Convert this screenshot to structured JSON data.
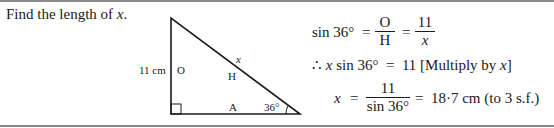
{
  "question": {
    "text": "Find the length of ",
    "variable": "x",
    "end": "."
  },
  "diagram": {
    "side_label": "11 cm",
    "opposite": "O",
    "hypotenuse": "H",
    "hyp_var": "x",
    "adjacent": "A",
    "angle": "36°"
  },
  "working": {
    "line1": {
      "lhs": "sin 36°",
      "eq": "=",
      "frac1_num": "O",
      "frac1_den": "H",
      "eq2": "=",
      "frac2_num": "11",
      "frac2_den": "x"
    },
    "line2": {
      "therefore": "∴",
      "var": "x",
      "rest": " sin 36°  =  11",
      "note": "[Multiply by ",
      "note_var": "x",
      "note_end": "]"
    },
    "line3": {
      "var": "x",
      "eq": "=",
      "num": "11",
      "den": "sin 36°",
      "result": "=  18·7 cm (to 3 s.f.)"
    }
  }
}
